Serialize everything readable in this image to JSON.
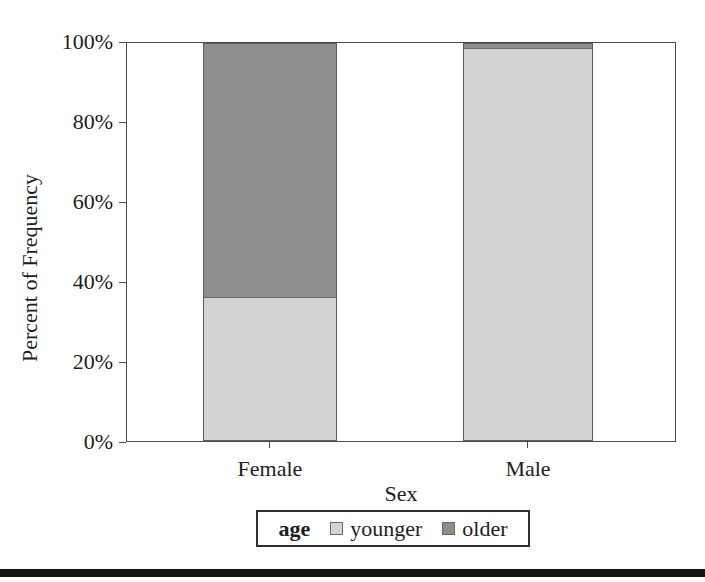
{
  "chart_data": {
    "type": "bar",
    "subtype": "100-percent-stacked-column",
    "categories": [
      "Female",
      "Male"
    ],
    "series": [
      {
        "name": "younger",
        "color": "#d3d3d3",
        "values": [
          36,
          99
        ]
      },
      {
        "name": "older",
        "color": "#8e8e8e",
        "values": [
          64,
          1
        ]
      }
    ],
    "xlabel": "Sex",
    "ylabel": "Percent of Frequency",
    "y_ticks": [
      "0%",
      "20%",
      "40%",
      "60%",
      "80%",
      "100%"
    ],
    "ylim": [
      0,
      100
    ],
    "grid": "off",
    "legend_title": "age",
    "legend_position": "bottom-center"
  }
}
